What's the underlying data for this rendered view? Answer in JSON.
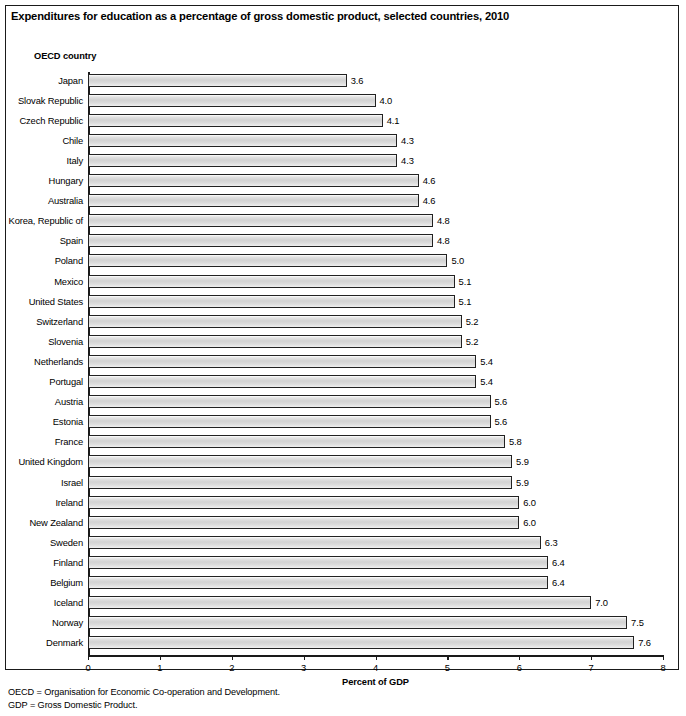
{
  "figure": {
    "title": "Expenditures for education as a percentage of gross domestic product, selected countries, 2010",
    "axis_group_label": "OECD country",
    "x_axis_title": "Percent of GDP",
    "footnotes": [
      "OECD = Organisation for Economic Co-operation and Development.",
      "GDP = Gross Domestic Product."
    ],
    "colors": {
      "bar_fill": "#d8d8d8",
      "bar_border": "#222222",
      "axis": "#1a1a1a",
      "frame": "#1a1a1a",
      "text": "#000000",
      "background": "#ffffff"
    }
  },
  "chart_data": {
    "type": "bar",
    "orientation": "horizontal",
    "title": "Expenditures for education as a percentage of gross domestic product, selected countries, 2010",
    "xlabel": "Percent of GDP",
    "ylabel": "OECD country",
    "xlim": [
      0,
      8
    ],
    "xticks": [
      0,
      1,
      2,
      3,
      4,
      5,
      6,
      7,
      8
    ],
    "xtick_labels": [
      "0",
      "1",
      "2",
      "3",
      "4",
      "5",
      "6",
      "7",
      "8"
    ],
    "grid": false,
    "legend": null,
    "sort_order": "ascending",
    "categories": [
      "Japan",
      "Slovak Republic",
      "Czech Republic",
      "Chile",
      "Italy",
      "Hungary",
      "Australia",
      "Korea, Republic of",
      "Spain",
      "Poland",
      "Mexico",
      "United States",
      "Switzerland",
      "Slovenia",
      "Netherlands",
      "Portugal",
      "Austria",
      "Estonia",
      "France",
      "United Kingdom",
      "Israel",
      "Ireland",
      "New Zealand",
      "Sweden",
      "Finland",
      "Belgium",
      "Iceland",
      "Norway",
      "Denmark"
    ],
    "values": [
      3.6,
      4.0,
      4.1,
      4.3,
      4.3,
      4.6,
      4.6,
      4.8,
      4.8,
      5.0,
      5.1,
      5.1,
      5.2,
      5.2,
      5.4,
      5.4,
      5.6,
      5.6,
      5.8,
      5.9,
      5.9,
      6.0,
      6.0,
      6.3,
      6.4,
      6.4,
      7.0,
      7.5,
      7.6
    ],
    "value_labels": [
      "3.6",
      "4.0",
      "4.1",
      "4.3",
      "4.3",
      "4.6",
      "4.6",
      "4.8",
      "4.8",
      "5.0",
      "5.1",
      "5.1",
      "5.2",
      "5.2",
      "5.4",
      "5.4",
      "5.6",
      "5.6",
      "5.8",
      "5.9",
      "5.9",
      "6.0",
      "6.0",
      "6.3",
      "6.4",
      "6.4",
      "7.0",
      "7.5",
      "7.6"
    ]
  }
}
